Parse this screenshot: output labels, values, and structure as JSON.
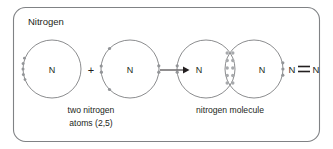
{
  "figure": {
    "title": "Nitrogen",
    "background_color": "#ffffff",
    "frame_color": "#808285",
    "ink_color": "#231f20",
    "shell_color": "#6d6e71",
    "electron_color": "#939598",
    "shared_electron_color": "#a7a9ac"
  },
  "reactants": {
    "caption_line1": "two nitrogen",
    "caption_line2": "atoms (2,5)",
    "operator": "+",
    "atoms": [
      {
        "symbol": "N",
        "name": "nitrogen-atom-left",
        "cx": 52,
        "cy": 69,
        "r": 29,
        "electron_count": 5,
        "electron_angles": [
          180,
          180,
          172,
          188,
          200
        ]
      },
      {
        "symbol": "N",
        "name": "nitrogen-atom-right",
        "cx": 130,
        "cy": 69,
        "r": 29,
        "electron_count": 5,
        "electron_angles": [
          135,
          180,
          225,
          0,
          10
        ]
      }
    ]
  },
  "arrow": {
    "label": "reaction-arrow",
    "x1": 160,
    "x2": 186,
    "y": 70
  },
  "product": {
    "caption": "nitrogen molecule",
    "formula": {
      "left_symbol": "N",
      "right_symbol": "N",
      "bond_type": "triple"
    },
    "atoms": [
      {
        "symbol": "N",
        "name": "molecule-atom-left",
        "cx": 206,
        "cy": 69,
        "r": 29,
        "electron_angles": [
          180,
          172,
          188
        ]
      },
      {
        "symbol": "N",
        "name": "molecule-atom-right",
        "cx": 254,
        "cy": 69,
        "r": 29,
        "electron_angles": [
          0,
          8,
          352
        ]
      }
    ],
    "shared_electrons": {
      "count": 6,
      "description": "triple bond shared pair region",
      "cx": 230,
      "rows": [
        52,
        60,
        68,
        76,
        84
      ],
      "columns": [
        227.2,
        232.8
      ]
    }
  }
}
